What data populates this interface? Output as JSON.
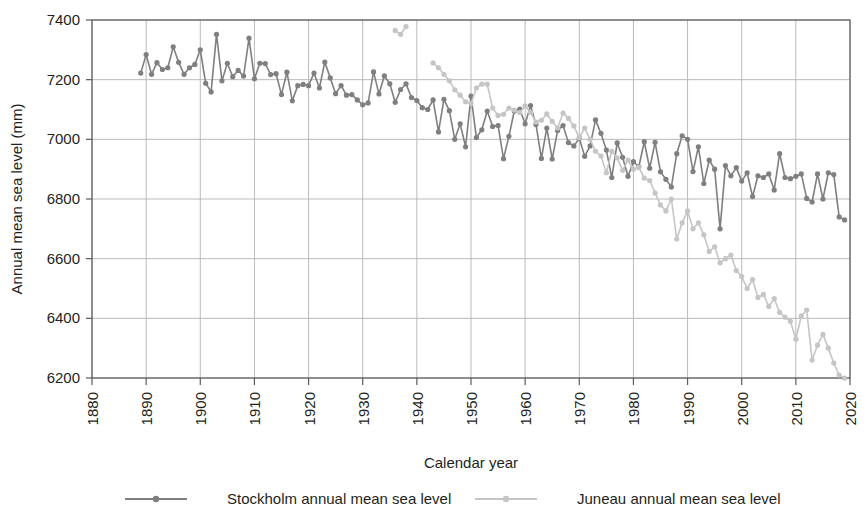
{
  "chart_data": {
    "type": "line",
    "title": "",
    "xlabel": "Calendar year",
    "ylabel": "Annual mean sea level (mm)",
    "xlim": [
      1880,
      2020
    ],
    "ylim": [
      6200,
      7400
    ],
    "xticks": [
      1880,
      1890,
      1900,
      1910,
      1920,
      1930,
      1940,
      1950,
      1960,
      1970,
      1980,
      1990,
      2000,
      2010,
      2020
    ],
    "yticks": [
      6200,
      6400,
      6600,
      6800,
      7000,
      7200,
      7400
    ],
    "grid": true,
    "legend_position": "bottom",
    "markers": true,
    "series": [
      {
        "name": "Stockholm annual mean sea level",
        "color": "#7f7f7f",
        "x": [
          1889,
          1890,
          1891,
          1892,
          1893,
          1894,
          1895,
          1896,
          1897,
          1898,
          1899,
          1900,
          1901,
          1902,
          1903,
          1904,
          1905,
          1906,
          1907,
          1908,
          1909,
          1910,
          1911,
          1912,
          1913,
          1914,
          1915,
          1916,
          1917,
          1918,
          1919,
          1920,
          1921,
          1922,
          1923,
          1924,
          1925,
          1926,
          1927,
          1928,
          1929,
          1930,
          1931,
          1932,
          1933,
          1934,
          1935,
          1936,
          1937,
          1938,
          1939,
          1940,
          1941,
          1942,
          1943,
          1944,
          1945,
          1946,
          1947,
          1948,
          1949,
          1950,
          1951,
          1952,
          1953,
          1954,
          1955,
          1956,
          1957,
          1958,
          1959,
          1960,
          1961,
          1962,
          1963,
          1964,
          1965,
          1966,
          1967,
          1968,
          1969,
          1970,
          1971,
          1972,
          1973,
          1974,
          1975,
          1976,
          1977,
          1978,
          1979,
          1980,
          1981,
          1982,
          1983,
          1984,
          1985,
          1986,
          1987,
          1988,
          1989,
          1990,
          1991,
          1992,
          1993,
          1994,
          1995,
          1996,
          1997,
          1998,
          1999,
          2000,
          2001,
          2002,
          2003,
          2004,
          2005,
          2006,
          2007,
          2008,
          2009,
          2010,
          2011,
          2012,
          2013,
          2014,
          2015,
          2016,
          2017,
          2018,
          2019
        ],
        "y": [
          7222,
          7284,
          7218,
          7257,
          7234,
          7240,
          7310,
          7258,
          7218,
          7240,
          7251,
          7300,
          7188,
          7159,
          7352,
          7196,
          7255,
          7210,
          7231,
          7212,
          7339,
          7203,
          7255,
          7254,
          7217,
          7220,
          7150,
          7225,
          7129,
          7180,
          7184,
          7180,
          7222,
          7172,
          7259,
          7206,
          7153,
          7180,
          7148,
          7150,
          7132,
          7116,
          7122,
          7226,
          7152,
          7213,
          7186,
          7124,
          7167,
          7186,
          7140,
          7130,
          7106,
          7100,
          7132,
          7025,
          7134,
          7096,
          7000,
          7052,
          6975,
          7145,
          7006,
          7032,
          7095,
          7043,
          7046,
          6935,
          7010,
          7095,
          7101,
          7052,
          7113,
          7050,
          6936,
          7038,
          6934,
          7030,
          7046,
          6989,
          6978,
          7003,
          6943,
          6978,
          7065,
          7020,
          6964,
          6872,
          6988,
          6940,
          6876,
          6925,
          6908,
          6992,
          6903,
          6990,
          6891,
          6866,
          6840,
          6952,
          7012,
          7000,
          6892,
          6975,
          6852,
          6930,
          6900,
          6700,
          6912,
          6878,
          6905,
          6860,
          6888,
          6808,
          6878,
          6872,
          6884,
          6830,
          6952,
          6872,
          6868,
          6876,
          6884,
          6802,
          6790,
          6884,
          6800,
          6888,
          6882,
          6740,
          6730
        ]
      },
      {
        "name": "Juneau annual mean sea level",
        "color": "#c5c5c5",
        "x": [
          1936,
          1937,
          1938,
          1943,
          1944,
          1945,
          1946,
          1947,
          1948,
          1949,
          1950,
          1951,
          1952,
          1953,
          1954,
          1955,
          1956,
          1957,
          1958,
          1959,
          1960,
          1961,
          1962,
          1963,
          1964,
          1965,
          1966,
          1967,
          1968,
          1969,
          1970,
          1971,
          1972,
          1973,
          1974,
          1975,
          1976,
          1977,
          1978,
          1979,
          1980,
          1981,
          1982,
          1983,
          1984,
          1985,
          1986,
          1987,
          1988,
          1989,
          1990,
          1991,
          1992,
          1993,
          1994,
          1995,
          1996,
          1997,
          1998,
          1999,
          2000,
          2001,
          2002,
          2003,
          2004,
          2005,
          2006,
          2007,
          2008,
          2009,
          2010,
          2011,
          2012,
          2013,
          2014,
          2015,
          2016,
          2017,
          2018,
          2019
        ],
        "y": [
          7365,
          7352,
          7378,
          7256,
          7240,
          7218,
          7196,
          7166,
          7148,
          7126,
          7120,
          7172,
          7185,
          7185,
          7105,
          7080,
          7084,
          7105,
          7098,
          7090,
          7112,
          7090,
          7058,
          7064,
          7085,
          7060,
          7038,
          7088,
          7070,
          7045,
          7005,
          7038,
          7000,
          6960,
          6944,
          6888,
          6960,
          6938,
          6896,
          6930,
          6900,
          6906,
          6870,
          6862,
          6820,
          6780,
          6760,
          6800,
          6666,
          6720,
          6760,
          6700,
          6720,
          6680,
          6624,
          6640,
          6586,
          6600,
          6612,
          6560,
          6540,
          6500,
          6530,
          6470,
          6480,
          6440,
          6466,
          6420,
          6404,
          6390,
          6330,
          6408,
          6428,
          6260,
          6310,
          6346,
          6300,
          6250,
          6210,
          6200
        ]
      }
    ]
  },
  "legend": {
    "items": [
      {
        "label": "Stockholm annual mean sea level",
        "color": "#7f7f7f"
      },
      {
        "label": "Juneau annual mean sea level",
        "color": "#c5c5c5"
      }
    ]
  },
  "axis": {
    "y_title": "Annual mean sea level (mm)",
    "x_title": "Calendar year",
    "y_tick_labels": [
      "7400",
      "7200",
      "7000",
      "6800",
      "6600",
      "6400",
      "6200"
    ],
    "x_tick_labels": [
      "1880",
      "1890",
      "1900",
      "1910",
      "1920",
      "1930",
      "1940",
      "1950",
      "1960",
      "1970",
      "1980",
      "1990",
      "2000",
      "2010",
      "2020"
    ]
  }
}
